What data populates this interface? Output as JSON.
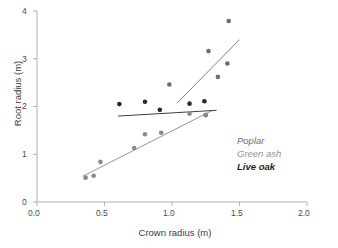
{
  "chart_data": {
    "type": "scatter",
    "title": "",
    "xlabel": "Crown radius (m)",
    "ylabel": "Root radius (m)",
    "xlim": [
      0.0,
      2.0
    ],
    "ylim": [
      0,
      4
    ],
    "xticks": [
      "0.0",
      "0.5",
      "1.0",
      "1.5",
      "2.0"
    ],
    "xtick_values": [
      0.0,
      0.5,
      1.0,
      1.5,
      2.0
    ],
    "yticks": [
      "0",
      "1",
      "2",
      "3",
      "4"
    ],
    "ytick_values": [
      0,
      1,
      2,
      3,
      4
    ],
    "grid": false,
    "legend_position": "inside-lower-right",
    "series": [
      {
        "name": "Poplar",
        "color": "#6e6e6e",
        "marker": "filled-circle",
        "points": [
          {
            "x": 0.98,
            "y": 2.46
          },
          {
            "x": 1.27,
            "y": 3.16
          },
          {
            "x": 1.42,
            "y": 3.79
          },
          {
            "x": 1.34,
            "y": 2.62
          },
          {
            "x": 1.41,
            "y": 2.9
          },
          {
            "x": 1.25,
            "y": 1.82
          }
        ],
        "trendline": {
          "x1": 1.04,
          "y1": 2.08,
          "x2": 1.5,
          "y2": 3.4
        }
      },
      {
        "name": "Green ash",
        "color": "#8a8a8a",
        "marker": "filled-circle",
        "points": [
          {
            "x": 0.36,
            "y": 0.51
          },
          {
            "x": 0.42,
            "y": 0.55
          },
          {
            "x": 0.47,
            "y": 0.84
          },
          {
            "x": 0.72,
            "y": 1.13
          },
          {
            "x": 0.8,
            "y": 1.42
          },
          {
            "x": 0.92,
            "y": 1.45
          },
          {
            "x": 1.13,
            "y": 1.85
          },
          {
            "x": 1.25,
            "y": 1.82
          }
        ],
        "trendline": {
          "x1": 0.34,
          "y1": 0.54,
          "x2": 1.3,
          "y2": 1.92
        }
      },
      {
        "name": "Live oak",
        "color": "#2a2a2a",
        "marker": "filled-circle",
        "points": [
          {
            "x": 0.61,
            "y": 2.05
          },
          {
            "x": 0.8,
            "y": 2.1
          },
          {
            "x": 0.91,
            "y": 1.93
          },
          {
            "x": 1.13,
            "y": 2.06
          },
          {
            "x": 1.24,
            "y": 2.11
          }
        ],
        "trendline": {
          "x1": 0.6,
          "y1": 1.8,
          "x2": 1.33,
          "y2": 1.92
        }
      }
    ],
    "legend": [
      {
        "label": "Poplar",
        "color": "#6e6e6e",
        "weight": "normal"
      },
      {
        "label": "Green ash",
        "color": "#939393",
        "weight": "normal"
      },
      {
        "label": "Live oak",
        "color": "#1e1e1e",
        "weight": "bold"
      }
    ]
  },
  "axes": {
    "x_title": "Crown radius (m)",
    "y_title": "Root radius (m)",
    "x_tick_labels": [
      "0.0",
      "0.5",
      "1.0",
      "1.5",
      "2.0"
    ],
    "y_tick_labels": [
      "0",
      "1",
      "2",
      "3",
      "4"
    ],
    "axis_color": "#b0b0b0"
  },
  "legend": {
    "poplar": "Poplar",
    "green_ash": "Green ash",
    "live_oak": "Live oak"
  }
}
